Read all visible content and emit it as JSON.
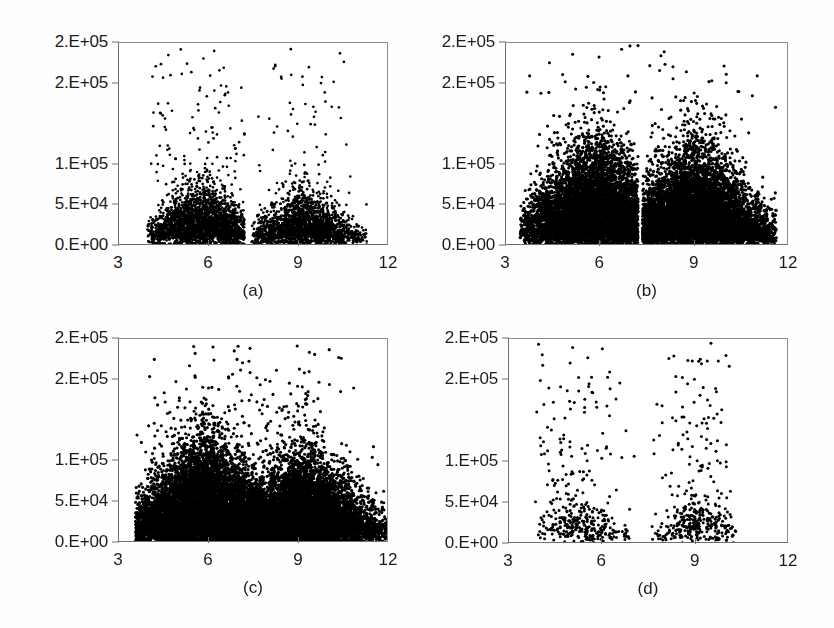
{
  "figure": {
    "title": "",
    "layout": "2x2 grid of scatter plots",
    "marker_color": "#000000",
    "axis_color": "#6e6e6e",
    "background": "#ffffff"
  },
  "chart_data": [
    {
      "type": "scatter",
      "panel": "a",
      "caption": "(a)",
      "title": "",
      "xlabel": "",
      "ylabel": "",
      "xlim": [
        3,
        12
      ],
      "ylim": [
        0,
        250000
      ],
      "grid": false,
      "legend": null,
      "xticks": [
        3,
        6,
        9,
        12
      ],
      "xticklabels": [
        "3",
        "6",
        "9",
        "12"
      ],
      "yticks": [
        0,
        50000,
        100000,
        200000,
        250000
      ],
      "yticklabels": [
        "0.E+00",
        "5.E+04",
        "1.E+05",
        "2.E+05",
        "2.E+05"
      ],
      "n_points": 4200,
      "description": "Bimodal point cloud: dense left lobe from x~4.0 to 7.2 peaking near x=5.8, clean vertical gap at x~7.25, second lobe x~7.4 to 11.2 peaking near x=9.2. Bulk of mass below 1.0E+05 with sparse outliers up to 2.4E+05 concentrated near x=5-6.5.",
      "clusters": [
        {
          "x_center": 5.8,
          "x_spread": 1.05,
          "x_min": 3.95,
          "x_max": 7.2,
          "y_peak": 35000,
          "y_spread": 26000,
          "y_max_dense": 100000,
          "weight": 0.55
        },
        {
          "x_center": 9.15,
          "x_spread": 0.95,
          "x_min": 7.4,
          "x_max": 11.3,
          "y_peak": 32000,
          "y_spread": 23000,
          "y_max_dense": 92000,
          "weight": 0.45
        }
      ],
      "outlier_fraction": 0.055,
      "outlier_y_max": 245000,
      "gap": {
        "x_start": 7.18,
        "x_end": 7.42
      }
    },
    {
      "type": "scatter",
      "panel": "b",
      "caption": "(b)",
      "title": "",
      "xlabel": "",
      "ylabel": "",
      "xlim": [
        3,
        12
      ],
      "ylim": [
        0,
        250000
      ],
      "grid": false,
      "legend": null,
      "xticks": [
        3,
        6,
        9,
        12
      ],
      "xticklabels": [
        "3",
        "6",
        "9",
        "12"
      ],
      "yticks": [
        0,
        50000,
        100000,
        200000,
        250000
      ],
      "yticklabels": [
        "0.E+00",
        "5.E+04",
        "1.E+05",
        "2.E+05",
        "2.E+05"
      ],
      "n_points": 12000,
      "description": "Very dense bimodal cloud filling most of the frame. Left lobe x~3.5 to 7.2, right lobe x~7.3 to 11.5, narrow vertical gap at x~7.25. Saturated black below 1.0E+05, heavy scatter continuing up to the 2.5E+05 top edge between x=5 and x=10.",
      "clusters": [
        {
          "x_center": 5.9,
          "x_spread": 1.25,
          "x_min": 3.45,
          "x_max": 7.22,
          "y_peak": 45000,
          "y_spread": 48000,
          "y_max_dense": 250000,
          "weight": 0.5
        },
        {
          "x_center": 9.0,
          "x_spread": 1.2,
          "x_min": 7.3,
          "x_max": 11.6,
          "y_peak": 42000,
          "y_spread": 45000,
          "y_max_dense": 250000,
          "weight": 0.5
        }
      ],
      "outlier_fraction": 0.02,
      "outlier_y_max": 250000,
      "gap": {
        "x_start": 7.2,
        "x_end": 7.34
      }
    },
    {
      "type": "scatter",
      "panel": "c",
      "caption": "(c)",
      "title": "",
      "xlabel": "",
      "ylabel": "",
      "xlim": [
        3,
        12
      ],
      "ylim": [
        0,
        250000
      ],
      "grid": false,
      "legend": null,
      "xticks": [
        3,
        6,
        9,
        12
      ],
      "xticklabels": [
        "3",
        "6",
        "9",
        "12"
      ],
      "yticks": [
        0,
        50000,
        100000,
        200000,
        250000
      ],
      "yticklabels": [
        "0.E+00",
        "5.E+04",
        "1.E+05",
        "2.E+05",
        "2.E+05"
      ],
      "n_points": 14000,
      "description": "Densest panel; continuous saturated mass from x~3.6 all the way to x=12 with no clean gap, only a small light patch near x=7-8 just above the baseline. Broad dense body up to ~1.3E+05 between x=4.5 and x=10, thinning scatter above that reaching the 2.5E+05 top edge.",
      "clusters": [
        {
          "x_center": 5.9,
          "x_spread": 1.3,
          "x_min": 3.55,
          "x_max": 12.0,
          "y_peak": 48000,
          "y_spread": 44000,
          "y_max_dense": 250000,
          "weight": 0.56
        },
        {
          "x_center": 9.1,
          "x_spread": 1.3,
          "x_min": 3.55,
          "x_max": 12.0,
          "y_peak": 42000,
          "y_spread": 40000,
          "y_max_dense": 250000,
          "weight": 0.44
        }
      ],
      "outlier_fraction": 0.03,
      "outlier_y_max": 250000,
      "gap": null
    },
    {
      "type": "scatter",
      "panel": "d",
      "caption": "(d)",
      "title": "",
      "xlabel": "",
      "ylabel": "",
      "xlim": [
        3,
        12
      ],
      "ylim": [
        0,
        250000
      ],
      "grid": false,
      "legend": null,
      "xticks": [
        3,
        6,
        9,
        12
      ],
      "xticklabels": [
        "3",
        "6",
        "9",
        "12"
      ],
      "yticks": [
        0,
        50000,
        100000,
        200000,
        250000
      ],
      "yticklabels": [
        "0.E+00",
        "5.E+04",
        "1.E+05",
        "2.E+05",
        "2.E+05"
      ],
      "n_points": 760,
      "description": "Sparsest panel; individual markers clearly resolved. Two loose clusters centred near x=5.2 and x=9.1, each concentrated between 1.5E+04 and 5.5E+04. Thin scatter of isolated points rises through 1.0E+05 to the top edge, mostly between x=4.5 and x=9.8. A handful of stragglers extend right to x~11.8.",
      "clusters": [
        {
          "x_center": 5.2,
          "x_spread": 0.85,
          "x_min": 3.8,
          "x_max": 7.15,
          "y_peak": 32000,
          "y_spread": 18000,
          "y_max_dense": 70000,
          "weight": 0.5
        },
        {
          "x_center": 9.1,
          "x_spread": 0.75,
          "x_min": 7.5,
          "x_max": 10.3,
          "y_peak": 33000,
          "y_spread": 19000,
          "y_max_dense": 75000,
          "weight": 0.5
        }
      ],
      "outlier_fraction": 0.3,
      "outlier_y_max": 250000,
      "gap": {
        "x_start": 7.15,
        "x_end": 7.45
      }
    }
  ]
}
